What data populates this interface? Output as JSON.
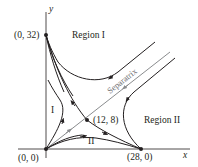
{
  "diagram": {
    "type": "phase-plane",
    "axes": {
      "x_label": "x",
      "y_label": "y"
    },
    "equilibria": [
      {
        "label": "(0, 32)",
        "x": 0,
        "y": 32
      },
      {
        "label": "(0, 0)",
        "x": 0,
        "y": 0
      },
      {
        "label": "(28, 0)",
        "x": 28,
        "y": 0
      },
      {
        "label": "(12, 8)",
        "x": 12,
        "y": 8
      }
    ],
    "regions": [
      {
        "label": "Region I"
      },
      {
        "label": "Region II"
      },
      {
        "label": "I"
      },
      {
        "label": "II"
      }
    ],
    "separatrix": {
      "label": "Separatrix"
    },
    "colors": {
      "trajectory": "#231f20",
      "separatrix": "#8a8c8e",
      "axis": "#231f20"
    }
  }
}
